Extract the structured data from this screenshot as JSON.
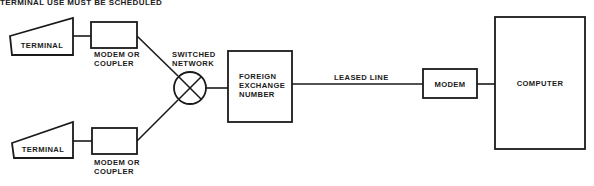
{
  "title": "TERMINAL USE MUST BE SCHEDULED",
  "nodes": {
    "terminal_top": {
      "label": "TERMINAL"
    },
    "modem_top": {
      "label_lines": [
        "MODEM OR",
        "COUPLER"
      ]
    },
    "terminal_bottom": {
      "label": "TERMINAL"
    },
    "modem_bottom": {
      "label_lines": [
        "MODEM OR",
        "COUPLER"
      ]
    },
    "switched_network": {
      "label_lines": [
        "SWITCHED",
        "NETWORK"
      ]
    },
    "foreign_exchange": {
      "label_lines": [
        "FOREIGN",
        "EXCHANGE",
        "NUMBER"
      ]
    },
    "modem": {
      "label": "MODEM"
    },
    "computer": {
      "label": "COMPUTER"
    }
  },
  "links": {
    "leased_line": {
      "label": "LEASED LINE"
    }
  },
  "colors": {
    "ink": "#1a1a1a",
    "background": "#ffffff"
  }
}
